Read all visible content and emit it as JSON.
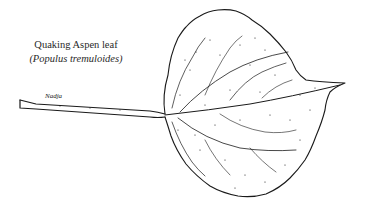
{
  "illustration": {
    "title": "Quaking Aspen leaf",
    "scientific_name": "(Populus tremuloides)",
    "signature": "Nadja",
    "subject": "leaf-with-petiole",
    "style": "pen-and-ink stipple",
    "colors": {
      "ink": "#1a1a1a",
      "background": "#ffffff"
    }
  }
}
